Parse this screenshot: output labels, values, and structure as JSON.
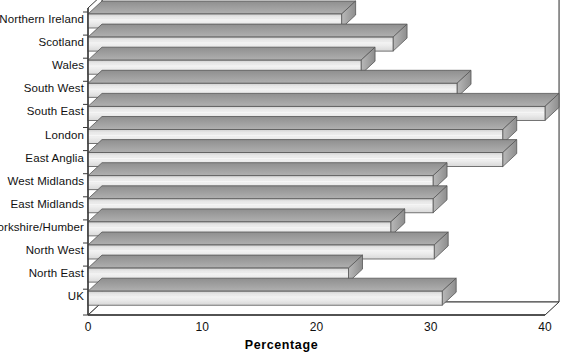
{
  "chart_data": {
    "type": "bar",
    "orientation": "horizontal",
    "style": "3d-extruded-bar",
    "title": "",
    "xlabel": "Percentage",
    "ylabel": "",
    "xlim": [
      0,
      40
    ],
    "ylim": null,
    "xticks": [
      0,
      10,
      20,
      30,
      40
    ],
    "xtick_labels": [
      "0",
      "10",
      "20",
      "30",
      "40"
    ],
    "grid": "vertical-gridlines-only",
    "legend": "none",
    "categories": [
      "Northern Ireland",
      "Scotland",
      "Wales",
      "South West",
      "South East",
      "London",
      "East Anglia",
      "West Midlands",
      "East Midlands",
      "Yorkshire/Humber",
      "North West",
      "North East",
      "UK"
    ],
    "values": [
      22.2,
      26.7,
      23.9,
      32.3,
      40.0,
      36.3,
      36.3,
      30.2,
      30.2,
      26.5,
      30.3,
      22.8,
      31.0
    ],
    "series": [
      {
        "name": "Percentage",
        "values": [
          22.2,
          26.7,
          23.9,
          32.3,
          40.0,
          36.3,
          36.3,
          30.2,
          30.2,
          26.5,
          30.3,
          22.8,
          31.0
        ]
      }
    ],
    "colors": {
      "bar_front_light": "#ebebeb",
      "bar_front_dark": "#cfcfcf",
      "bar_top": "#9a9a9a",
      "bar_side": "#b4b4b4",
      "bar_outline": "#555555",
      "axis_line": "#3a3a3a",
      "gridline": "#b8b8b8",
      "background": "#ffffff",
      "text": "#111111"
    }
  },
  "axis_title": "Percentage"
}
